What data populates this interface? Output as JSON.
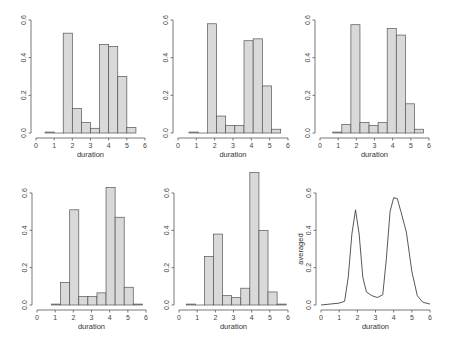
{
  "chart_data": [
    {
      "type": "bar",
      "panel": 1,
      "xlabel": "duration",
      "ylabel": "",
      "xlim": [
        0,
        6
      ],
      "ylim": [
        0,
        0.6
      ],
      "x_ticks": [
        "0",
        "1",
        "2",
        "3",
        "4",
        "5",
        "6"
      ],
      "y_ticks": [
        "0.0",
        "0.2",
        "0.4",
        "0.6"
      ],
      "bin_start": 0.5,
      "bin_width": 0.5,
      "values": [
        0.005,
        0.0,
        0.53,
        0.13,
        0.055,
        0.025,
        0.47,
        0.46,
        0.3,
        0.03
      ]
    },
    {
      "type": "bar",
      "panel": 2,
      "xlabel": "duration",
      "ylabel": "",
      "xlim": [
        0,
        6
      ],
      "ylim": [
        0,
        0.6
      ],
      "x_ticks": [
        "0",
        "1",
        "2",
        "3",
        "4",
        "5",
        "6"
      ],
      "y_ticks": [
        "0.0",
        "0.2",
        "0.4",
        "0.6"
      ],
      "bin_start": 0.6,
      "bin_width": 0.5,
      "values": [
        0.005,
        0.0,
        0.58,
        0.09,
        0.04,
        0.04,
        0.49,
        0.5,
        0.25,
        0.02
      ]
    },
    {
      "type": "bar",
      "panel": 3,
      "xlabel": "duration",
      "ylabel": "",
      "xlim": [
        0,
        6
      ],
      "ylim": [
        0,
        0.6
      ],
      "x_ticks": [
        "0",
        "1",
        "2",
        "3",
        "4",
        "5",
        "6"
      ],
      "y_ticks": [
        "0.0",
        "0.2",
        "0.4",
        "0.6"
      ],
      "bin_start": 0.7,
      "bin_width": 0.5,
      "values": [
        0.005,
        0.045,
        0.575,
        0.055,
        0.04,
        0.055,
        0.555,
        0.52,
        0.155,
        0.02
      ]
    },
    {
      "type": "bar",
      "panel": 4,
      "xlabel": "duration",
      "ylabel": "",
      "xlim": [
        0,
        6
      ],
      "ylim": [
        0,
        0.6
      ],
      "x_ticks": [
        "0",
        "1",
        "2",
        "3",
        "4",
        "5",
        "6"
      ],
      "y_ticks": [
        "0.0",
        "0.2",
        "0.4",
        "0.6"
      ],
      "bin_start": 0.8,
      "bin_width": 0.5,
      "values": [
        0.005,
        0.12,
        0.51,
        0.045,
        0.045,
        0.065,
        0.63,
        0.47,
        0.095,
        0.005
      ]
    },
    {
      "type": "bar",
      "panel": 5,
      "xlabel": "duration",
      "ylabel": "",
      "xlim": [
        0,
        6
      ],
      "ylim": [
        0,
        0.6
      ],
      "x_ticks": [
        "0",
        "1",
        "2",
        "3",
        "4",
        "5",
        "6"
      ],
      "y_ticks": [
        "0.0",
        "0.2",
        "0.4",
        "0.6"
      ],
      "bin_start": 0.4,
      "bin_width": 0.5,
      "values": [
        0.005,
        0.0,
        0.26,
        0.38,
        0.05,
        0.04,
        0.09,
        0.71,
        0.4,
        0.07,
        0.005
      ]
    },
    {
      "type": "line",
      "panel": 6,
      "xlabel": "duration",
      "ylabel": "averaged",
      "xlim": [
        0,
        6
      ],
      "ylim": [
        0,
        0.6
      ],
      "x_ticks": [
        "0",
        "1",
        "2",
        "3",
        "4",
        "5",
        "6"
      ],
      "y_ticks": [
        "0.0",
        "0.2",
        "0.4",
        "0.6"
      ],
      "x": [
        0.0,
        0.5,
        1.0,
        1.3,
        1.5,
        1.7,
        1.9,
        2.1,
        2.3,
        2.5,
        2.8,
        3.1,
        3.4,
        3.6,
        3.8,
        4.0,
        4.2,
        4.4,
        4.7,
        5.0,
        5.3,
        5.6,
        6.0
      ],
      "y": [
        0.0,
        0.005,
        0.01,
        0.02,
        0.15,
        0.38,
        0.51,
        0.38,
        0.15,
        0.07,
        0.05,
        0.04,
        0.055,
        0.25,
        0.5,
        0.575,
        0.57,
        0.5,
        0.39,
        0.18,
        0.05,
        0.015,
        0.005
      ]
    }
  ]
}
